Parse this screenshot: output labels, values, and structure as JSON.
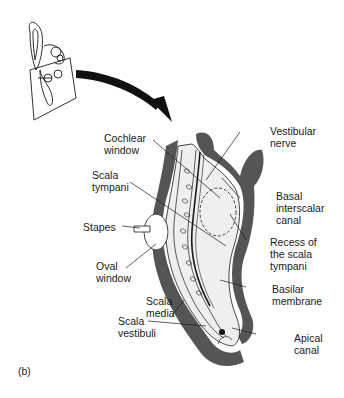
{
  "figure": {
    "panel_label": "(b)",
    "labels": {
      "cochlear_window": "Cochlear\nwindow",
      "vestibular_nerve": "Vestibular\nnerve",
      "scala_tympani": "Scala\ntympani",
      "basal_interscalar_canal": "Basal\ninterscalar\ncanal",
      "stapes": "Stapes",
      "recess_scala_tympani": "Recess of\nthe scala\ntympani",
      "oval_window": "Oval\nwindow",
      "basilar_membrane": "Basilar\nmembrane",
      "scala_media": "Scala\nmedia",
      "scala_vestibuli": "Scala\nvestibuli",
      "apical_canal": "Apical\ncanal"
    },
    "colors": {
      "ink": "#1a1a1a",
      "bone": "#555555",
      "fill": "#ececec"
    }
  }
}
